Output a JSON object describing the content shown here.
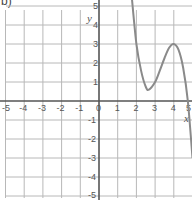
{
  "panel_label": "b)",
  "chart_data": {
    "type": "line",
    "title": "",
    "xlabel": "x",
    "ylabel": "y",
    "xlim": [
      -5,
      5
    ],
    "ylim": [
      -5,
      5
    ],
    "grid": true,
    "x_ticks": [
      -5,
      -4,
      -3,
      -2,
      -1,
      0,
      1,
      2,
      3,
      4,
      5
    ],
    "y_ticks": [
      5,
      4,
      3,
      2,
      1,
      -1,
      -2,
      -3,
      -4,
      -5
    ],
    "x_tick_labels": [
      "-5",
      "-4",
      "-3",
      "-2",
      "-1",
      "0",
      "1",
      "2",
      "3",
      "4",
      "5"
    ],
    "y_tick_labels": [
      "5",
      "4",
      "3",
      "2",
      "1",
      "-1",
      "-2",
      "-3",
      "-4",
      "-5"
    ],
    "series": [
      {
        "name": "cubic curve",
        "description": "Cubic decreasing from top near x=1.75, local minimum near (2.67, 0.6), local maximum at (4, 3), decreasing to about -3 at x=5",
        "x": [
          1.75,
          2.0,
          2.25,
          2.5,
          2.67,
          3.0,
          3.25,
          3.5,
          3.75,
          4.0,
          4.25,
          4.5,
          4.75,
          5.0
        ],
        "y": [
          5.5,
          3.0,
          1.6,
          0.75,
          0.6,
          1.0,
          1.6,
          2.25,
          2.8,
          3.0,
          2.7,
          1.75,
          0.0,
          -3.0
        ]
      }
    ]
  }
}
